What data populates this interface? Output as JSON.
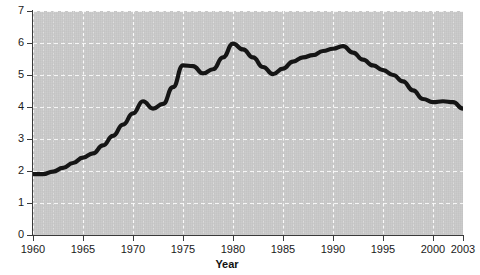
{
  "figure": {
    "cut_off_title": "",
    "background_color": "#c9c9c9",
    "line_color": "#151515",
    "gridline_color": "#ffffff",
    "axis_color": "#3a3a3a"
  },
  "axes": {
    "x_title": "Year",
    "y_title": "",
    "x_tick_labels": [
      "1960",
      "1965",
      "1970",
      "1975",
      "1980",
      "1985",
      "1990",
      "1995",
      "2000",
      "2003"
    ],
    "x_tick_values": [
      1960,
      1965,
      1970,
      1975,
      1980,
      1985,
      1990,
      1995,
      2000,
      2003
    ],
    "y_tick_labels": [
      "0",
      "1",
      "2",
      "3",
      "4",
      "5",
      "6",
      "7"
    ],
    "y_tick_values": [
      0,
      1,
      2,
      3,
      4,
      5,
      6,
      7
    ]
  },
  "chart_data": {
    "type": "line",
    "title": "",
    "xlabel": "Year",
    "ylabel": "",
    "xlim": [
      1960,
      2003
    ],
    "ylim": [
      0,
      7
    ],
    "grid": true,
    "legend": "none",
    "x": [
      1960,
      1961,
      1962,
      1963,
      1964,
      1965,
      1966,
      1967,
      1968,
      1969,
      1970,
      1971,
      1972,
      1973,
      1974,
      1975,
      1976,
      1977,
      1978,
      1979,
      1980,
      1981,
      1982,
      1983,
      1984,
      1985,
      1986,
      1987,
      1988,
      1989,
      1990,
      1991,
      1992,
      1993,
      1994,
      1995,
      1996,
      1997,
      1998,
      1999,
      2000,
      2001,
      2002,
      2003
    ],
    "values": [
      1.9,
      1.9,
      1.98,
      2.1,
      2.25,
      2.42,
      2.55,
      2.8,
      3.1,
      3.45,
      3.8,
      4.18,
      3.95,
      4.1,
      4.62,
      5.3,
      5.28,
      5.05,
      5.18,
      5.55,
      5.98,
      5.8,
      5.55,
      5.25,
      5.03,
      5.2,
      5.42,
      5.55,
      5.62,
      5.75,
      5.82,
      5.9,
      5.7,
      5.48,
      5.3,
      5.15,
      5.0,
      4.8,
      4.52,
      4.25,
      4.15,
      4.18,
      4.15,
      3.95
    ],
    "x_tick_labels": [
      "1960",
      "1965",
      "1970",
      "1975",
      "1980",
      "1985",
      "1990",
      "1995",
      "2000",
      "2003"
    ],
    "y_tick_labels": [
      "0",
      "1",
      "2",
      "3",
      "4",
      "5",
      "6",
      "7"
    ],
    "annotations": []
  }
}
